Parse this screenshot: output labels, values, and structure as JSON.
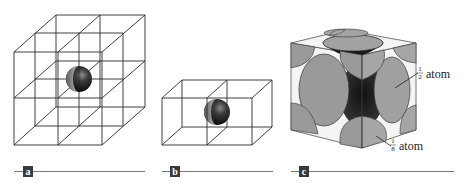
{
  "figure": {
    "panels": [
      {
        "id": "a",
        "label": "a",
        "description": "2x2x2 cubic lattice with a central atom"
      },
      {
        "id": "b",
        "label": "b",
        "description": "two adjacent unit cells sharing a face with atom at shared face"
      },
      {
        "id": "c",
        "label": "c",
        "description": "face-centered cubic unit cell, space-filling model"
      }
    ],
    "annotations": {
      "half_atom": {
        "numerator": "1",
        "denominator": "2",
        "text": "atom"
      },
      "eighth_atom": {
        "numerator": "1",
        "denominator": "8",
        "text": "atom"
      }
    },
    "colors": {
      "line": "#2a2a2a",
      "atom_face": "#9a9a9a",
      "atom_dark": "#1a1a1a",
      "cube_face_light": "#f4f4f4",
      "badge": "#3a3a3a",
      "rule": "#777777"
    }
  }
}
